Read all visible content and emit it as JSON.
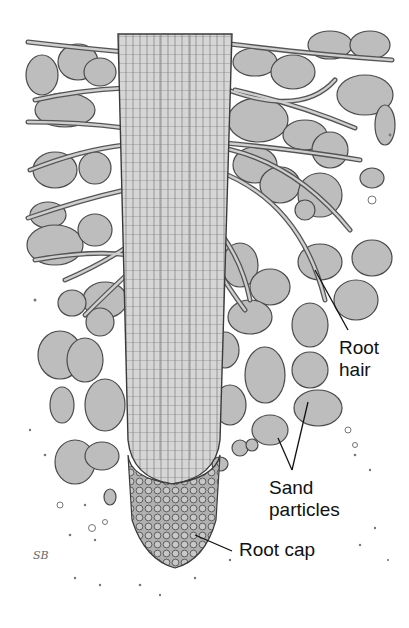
{
  "figure": {
    "labels": {
      "root_hair": [
        "Root",
        "hair"
      ],
      "sand_particles": [
        "Sand",
        "particles"
      ],
      "root_cap": "Root cap"
    },
    "signature": "SB"
  },
  "colors": {
    "background": "#ffffff",
    "particle_fill": "#b9b9b9",
    "particle_stroke": "#4a4a4a",
    "root_fill": "#cfcfcf",
    "root_stroke": "#3a3a3a",
    "label_text": "#111111"
  }
}
